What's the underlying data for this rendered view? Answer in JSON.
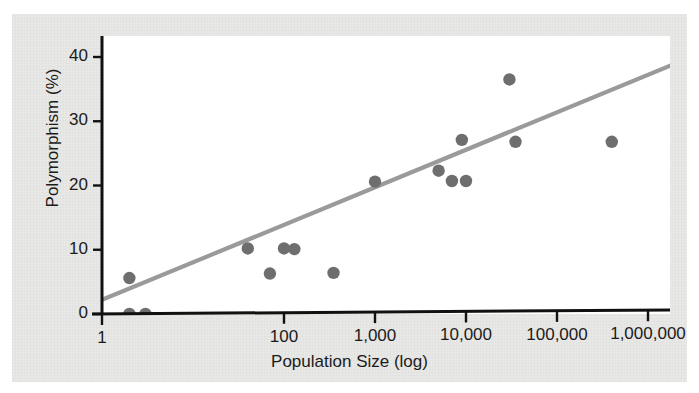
{
  "chart_data": {
    "type": "scatter",
    "title": "",
    "xlabel": "Population Size (log)",
    "ylabel": "Polymorphism (%)",
    "x_scale": "log",
    "xlim": [
      1,
      3000000
    ],
    "ylim": [
      0,
      43
    ],
    "grid": false,
    "legend": null,
    "x_tick_labels": [
      "1",
      "100",
      "1,000",
      "10,000",
      "100,000",
      "1,000,000"
    ],
    "x_tick_values": [
      1,
      100,
      1000,
      10000,
      100000,
      1000000
    ],
    "y_tick_labels": [
      "0",
      "10",
      "20",
      "30",
      "40"
    ],
    "y_tick_values": [
      0,
      10,
      20,
      30,
      40
    ],
    "series": [
      {
        "name": "Populations",
        "type": "scatter",
        "marker": "circle",
        "color": "#6e6e6e",
        "points": [
          {
            "x": 2,
            "y": 0.0
          },
          {
            "x": 3,
            "y": 0.0
          },
          {
            "x": 2,
            "y": 5.6
          },
          {
            "x": 40,
            "y": 10.2
          },
          {
            "x": 70,
            "y": 6.3
          },
          {
            "x": 100,
            "y": 10.2
          },
          {
            "x": 130,
            "y": 10.1
          },
          {
            "x": 350,
            "y": 6.4
          },
          {
            "x": 1000,
            "y": 20.6
          },
          {
            "x": 5000,
            "y": 22.3
          },
          {
            "x": 7000,
            "y": 20.7
          },
          {
            "x": 9000,
            "y": 27.1
          },
          {
            "x": 10000,
            "y": 20.7
          },
          {
            "x": 30000,
            "y": 36.5
          },
          {
            "x": 35000,
            "y": 26.8
          },
          {
            "x": 400000,
            "y": 26.8
          }
        ]
      },
      {
        "name": "Regression line",
        "type": "line",
        "color": "#9a9a9a",
        "endpoints": [
          {
            "x": 1,
            "y": 2.2
          },
          {
            "x": 2000000,
            "y": 39.0
          }
        ]
      }
    ]
  },
  "axes": {
    "y_title": "Polymorphism (%)",
    "x_title": "Population Size (log)"
  },
  "colors": {
    "marker": "#6e6e6e",
    "trend_line": "#9a9a9a",
    "axis": "#111111",
    "panel": "#ffffff",
    "paper": "#e8e8e6"
  }
}
